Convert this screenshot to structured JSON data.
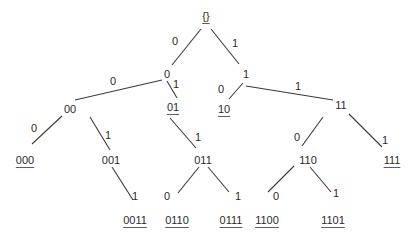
{
  "colors": {
    "text": "#2a2a2a",
    "edge": "#3a3a3a",
    "leaf_underline": "#5a5a7a"
  },
  "nodes": [
    {
      "id": "root",
      "label": "{}",
      "x": 206,
      "y": 16,
      "leaf": true
    },
    {
      "id": "0",
      "label": "0",
      "x": 167,
      "y": 74,
      "leaf": false
    },
    {
      "id": "1",
      "label": "1",
      "x": 246,
      "y": 74,
      "leaf": false
    },
    {
      "id": "00",
      "label": "00",
      "x": 70,
      "y": 109,
      "leaf": false
    },
    {
      "id": "01",
      "label": "01",
      "x": 173,
      "y": 107,
      "leaf": true
    },
    {
      "id": "10",
      "label": "10",
      "x": 224,
      "y": 109,
      "leaf": true
    },
    {
      "id": "11",
      "label": "11",
      "x": 341,
      "y": 105,
      "leaf": false
    },
    {
      "id": "000",
      "label": "000",
      "x": 25,
      "y": 160,
      "leaf": true
    },
    {
      "id": "001",
      "label": "001",
      "x": 111,
      "y": 160,
      "leaf": false
    },
    {
      "id": "011",
      "label": "011",
      "x": 203,
      "y": 160,
      "leaf": false
    },
    {
      "id": "110",
      "label": "110",
      "x": 308,
      "y": 160,
      "leaf": false
    },
    {
      "id": "111",
      "label": "111",
      "x": 392,
      "y": 160,
      "leaf": true
    },
    {
      "id": "0011",
      "label": "0011",
      "x": 135,
      "y": 220,
      "leaf": true
    },
    {
      "id": "0110",
      "label": "0110",
      "x": 177,
      "y": 220,
      "leaf": true
    },
    {
      "id": "0111",
      "label": "0111",
      "x": 231,
      "y": 220,
      "leaf": true
    },
    {
      "id": "1100",
      "label": "1100",
      "x": 267,
      "y": 220,
      "leaf": true
    },
    {
      "id": "1101",
      "label": "1101",
      "x": 333,
      "y": 220,
      "leaf": true
    }
  ],
  "edges": [
    {
      "from": "root",
      "to": "0",
      "label": "0",
      "x1": 201,
      "y1": 29,
      "x2": 172,
      "y2": 65,
      "lx": 175,
      "ly": 41
    },
    {
      "from": "root",
      "to": "1",
      "label": "1",
      "x1": 211,
      "y1": 29,
      "x2": 239,
      "y2": 64,
      "lx": 235,
      "ly": 43
    },
    {
      "from": "0",
      "to": "00",
      "label": "0",
      "x1": 162,
      "y1": 80,
      "x2": 75,
      "y2": 100,
      "lx": 113,
      "ly": 81
    },
    {
      "from": "0",
      "to": "01",
      "label": "1",
      "x1": 167,
      "y1": 81,
      "x2": 177,
      "y2": 98,
      "lx": 176,
      "ly": 84
    },
    {
      "from": "1",
      "to": "10",
      "label": "0",
      "x1": 243,
      "y1": 83,
      "x2": 229,
      "y2": 99,
      "lx": 221,
      "ly": 89
    },
    {
      "from": "1",
      "to": "11",
      "label": "1",
      "x1": 246,
      "y1": 86,
      "x2": 333,
      "y2": 100,
      "lx": 298,
      "ly": 86
    },
    {
      "from": "00",
      "to": "000",
      "label": "0",
      "x1": 62,
      "y1": 116,
      "x2": 32,
      "y2": 144,
      "lx": 34,
      "ly": 128
    },
    {
      "from": "00",
      "to": "001",
      "label": "1",
      "x1": 90,
      "y1": 117,
      "x2": 110,
      "y2": 150,
      "lx": 108,
      "ly": 135
    },
    {
      "from": "01",
      "to": "011",
      "label": "1",
      "x1": 170,
      "y1": 118,
      "x2": 196,
      "y2": 148,
      "lx": 198,
      "ly": 137
    },
    {
      "from": "11",
      "to": "110",
      "label": "0",
      "x1": 323,
      "y1": 117,
      "x2": 302,
      "y2": 146,
      "lx": 297,
      "ly": 137
    },
    {
      "from": "11",
      "to": "111",
      "label": "1",
      "x1": 349,
      "y1": 114,
      "x2": 382,
      "y2": 147,
      "lx": 385,
      "ly": 140
    },
    {
      "from": "001",
      "to": "0011",
      "label": "1",
      "x1": 112,
      "y1": 167,
      "x2": 133,
      "y2": 200,
      "lx": 135,
      "ly": 196
    },
    {
      "from": "011",
      "to": "0110",
      "label": "0",
      "x1": 199,
      "y1": 167,
      "x2": 178,
      "y2": 193,
      "lx": 167,
      "ly": 196
    },
    {
      "from": "011",
      "to": "0111",
      "label": "1",
      "x1": 208,
      "y1": 167,
      "x2": 229,
      "y2": 192,
      "lx": 238,
      "ly": 196
    },
    {
      "from": "110",
      "to": "1100",
      "label": "0",
      "x1": 294,
      "y1": 166,
      "x2": 268,
      "y2": 192,
      "lx": 276,
      "ly": 196
    },
    {
      "from": "110",
      "to": "1101",
      "label": "1",
      "x1": 310,
      "y1": 167,
      "x2": 331,
      "y2": 192,
      "lx": 336,
      "ly": 193
    }
  ]
}
